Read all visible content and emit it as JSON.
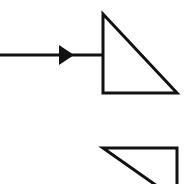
{
  "canvas": {
    "width": 186,
    "height": 184,
    "background_color": "#ffffff",
    "stroke_color": "#111111",
    "stroke_width": 3
  },
  "diagram": {
    "type": "line-drawing",
    "elements": [
      {
        "id": "arrow",
        "name": "arrow-right",
        "shaft": {
          "x1": 0,
          "y1": 55,
          "x2": 103,
          "y2": 55
        },
        "head": {
          "tip_x": 74,
          "tip_y": 55,
          "back_x": 59,
          "top_y": 45,
          "bottom_y": 65
        }
      },
      {
        "id": "triangle-upper",
        "name": "right-triangle-upper",
        "points": "103,14 103,93 177,93",
        "right_angle_corner": "bottom-left",
        "apex": {
          "x": 103,
          "y": 14
        },
        "bottom_left": {
          "x": 103,
          "y": 93
        },
        "bottom_right": {
          "x": 177,
          "y": 93
        }
      },
      {
        "id": "triangle-lower",
        "name": "right-triangle-lower-clipped",
        "points": "103,148 177,148 177,196 103,148",
        "right_angle_corner": "top-right",
        "top_left": {
          "x": 103,
          "y": 148
        },
        "top_right": {
          "x": 177,
          "y": 148
        },
        "clipped_edge": "bottom"
      }
    ]
  }
}
